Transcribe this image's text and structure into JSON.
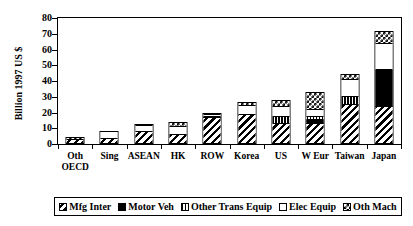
{
  "chart_data": {
    "type": "bar",
    "title": "",
    "subtitle": "",
    "xlabel": "",
    "ylabel": "Billion 1997 US $",
    "ylim": [
      0,
      80
    ],
    "yticks": [
      0,
      10,
      20,
      30,
      40,
      50,
      60,
      70,
      80
    ],
    "grid": false,
    "stacked": true,
    "legend_position": "bottom",
    "categories": [
      "Oth OECD",
      "Sing",
      "ASEAN",
      "HK",
      "ROW",
      "Korea",
      "US",
      "W Eur",
      "Taiwan",
      "Japan"
    ],
    "category_lines": [
      [
        "Oth",
        "OECD"
      ],
      [
        "Sing",
        ""
      ],
      [
        "ASEAN",
        ""
      ],
      [
        "HK",
        ""
      ],
      [
        "ROW",
        ""
      ],
      [
        "Korea",
        ""
      ],
      [
        "US",
        ""
      ],
      [
        "W Eur",
        ""
      ],
      [
        "Taiwan",
        ""
      ],
      [
        "Japan",
        ""
      ]
    ],
    "series": [
      {
        "name": "Mfg Inter",
        "pattern": "diagonal-hatch",
        "values": [
          3.2,
          3.0,
          7.5,
          6.0,
          17.5,
          18.5,
          13.0,
          12.5,
          25.0,
          23.0
        ]
      },
      {
        "name": "Motor Veh",
        "pattern": "solid-black",
        "values": [
          0.0,
          0.0,
          0.0,
          0.0,
          0.5,
          0.0,
          0.0,
          2.5,
          0.0,
          24.5
        ]
      },
      {
        "name": "Other Trans Equip",
        "pattern": "vertical-lines",
        "values": [
          0.0,
          0.0,
          0.0,
          0.0,
          0.0,
          0.0,
          4.0,
          2.5,
          5.0,
          0.0
        ]
      },
      {
        "name": "Elec Equip",
        "pattern": "white",
        "values": [
          0.0,
          5.5,
          4.5,
          5.5,
          1.0,
          6.0,
          7.0,
          4.5,
          11.0,
          16.5
        ]
      },
      {
        "name": "Oth Mach",
        "pattern": "checkerboard",
        "values": [
          1.3,
          0.0,
          0.7,
          2.3,
          0.5,
          2.0,
          4.0,
          11.0,
          3.5,
          8.0
        ]
      }
    ],
    "totals": [
      4.5,
      8.5,
      12.7,
      13.8,
      19.5,
      26.5,
      28.0,
      33.0,
      44.5,
      72.0
    ]
  },
  "legend": {
    "items": [
      {
        "label": "Mfg Inter",
        "swatch": "diagonal-hatch-swatch"
      },
      {
        "label": "Motor Veh",
        "swatch": "solid-black-swatch"
      },
      {
        "label": "Other Trans Equip",
        "swatch": "vertical-lines-swatch"
      },
      {
        "label": "Elec Equip",
        "swatch": "white-swatch"
      },
      {
        "label": "Oth Mach",
        "swatch": "checkerboard-swatch"
      }
    ]
  },
  "colors": {
    "ink": "#000000",
    "paper": "#ffffff"
  }
}
